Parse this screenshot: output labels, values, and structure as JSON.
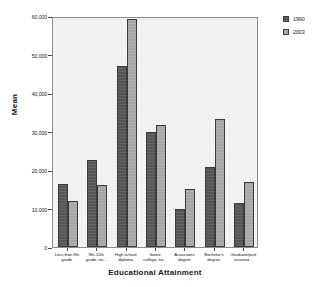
{
  "chart_data": {
    "type": "bar",
    "title": "",
    "xlabel": "Educational Attainment",
    "ylabel": "Mean",
    "ylim": [
      0,
      60000
    ],
    "yticks": [
      0,
      10000,
      20000,
      30000,
      40000,
      50000,
      60000
    ],
    "ytick_labels": [
      "0",
      "10,000",
      "20,000",
      "30,000",
      "40,000",
      "50,000",
      "60,000"
    ],
    "grid": false,
    "legend_position": "right",
    "categories": [
      "Less than 9th grade",
      "9th-12th grade, no...",
      "High school diploma",
      "Some college, no...",
      "Associates degree",
      "Bachelor's degree",
      "Graduate/prof essional..."
    ],
    "category_lines": [
      [
        "Less than 9th",
        "grade"
      ],
      [
        "9th-12th",
        "grade, no..."
      ],
      [
        "High school",
        "diploma"
      ],
      [
        "Some",
        "college, no..."
      ],
      [
        "Associates",
        "degree"
      ],
      [
        "Bachelor's",
        "degree"
      ],
      [
        "Graduate/prof",
        "essional..."
      ]
    ],
    "series": [
      {
        "name": "1990",
        "color": "#565656",
        "values": [
          16300,
          22600,
          47100,
          29800,
          9900,
          20800,
          11400
        ]
      },
      {
        "name": "2003",
        "color": "#a6a6a6",
        "values": [
          12000,
          16200,
          59100,
          31800,
          15000,
          33200,
          17000
        ]
      }
    ]
  },
  "legend": {
    "items": [
      {
        "label": "1990"
      },
      {
        "label": "2003"
      }
    ]
  }
}
